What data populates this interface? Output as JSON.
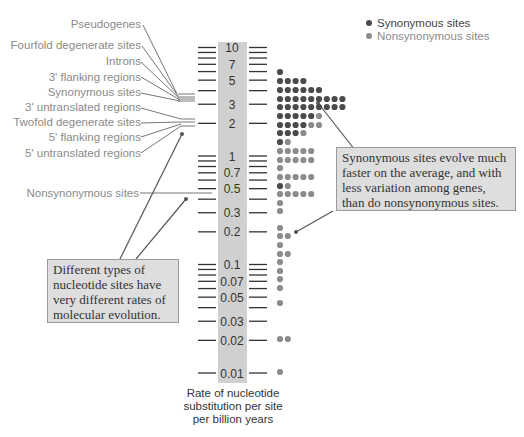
{
  "chart_data": {
    "type": "scatter",
    "title": "",
    "ylabel": "Rate of nucleotide substitution per site per billion years",
    "yscale": "log",
    "ylim": [
      0.01,
      10
    ],
    "tick_labels": [
      "10",
      "7",
      "5",
      "3",
      "2",
      "1",
      "0.7",
      "0.5",
      "0.3",
      "0.2",
      "0.1",
      "0.07",
      "0.05",
      "0.03",
      "0.02",
      "0.01"
    ],
    "tick_values": [
      10,
      7,
      5,
      3,
      2,
      1,
      0.7,
      0.5,
      0.3,
      0.2,
      0.1,
      0.07,
      0.05,
      0.03,
      0.02,
      0.01
    ],
    "legend": [
      {
        "name": "Synonymous sites",
        "color": "#4a4a4a"
      },
      {
        "name": "Nonsynonymous sites",
        "color": "#8c8c8c"
      }
    ],
    "dot_rows": [
      {
        "y": 72,
        "syn": 1,
        "nonsyn": 0
      },
      {
        "y": 81,
        "syn": 4,
        "nonsyn": 0
      },
      {
        "y": 90,
        "syn": 6,
        "nonsyn": 0
      },
      {
        "y": 99,
        "syn": 9,
        "nonsyn": 0
      },
      {
        "y": 107,
        "syn": 9,
        "nonsyn": 0
      },
      {
        "y": 116,
        "syn": 5,
        "nonsyn": 1
      },
      {
        "y": 125,
        "syn": 4,
        "nonsyn": 2
      },
      {
        "y": 133,
        "syn": 3,
        "nonsyn": 1
      },
      {
        "y": 142,
        "syn": 1,
        "nonsyn": 1
      },
      {
        "y": 151,
        "syn": 0,
        "nonsyn": 5
      },
      {
        "y": 160,
        "syn": 0,
        "nonsyn": 5
      },
      {
        "y": 168,
        "syn": 0,
        "nonsyn": 1
      },
      {
        "y": 177,
        "syn": 0,
        "nonsyn": 5
      },
      {
        "y": 186,
        "syn": 1,
        "nonsyn": 1
      },
      {
        "y": 194,
        "syn": 0,
        "nonsyn": 5
      },
      {
        "y": 203,
        "syn": 0,
        "nonsyn": 1
      },
      {
        "y": 211,
        "syn": 0,
        "nonsyn": 1
      },
      {
        "y": 228,
        "syn": 0,
        "nonsyn": 1
      },
      {
        "y": 236,
        "syn": 0,
        "nonsyn": 2
      },
      {
        "y": 245,
        "syn": 0,
        "nonsyn": 1
      },
      {
        "y": 254,
        "syn": 0,
        "nonsyn": 2
      },
      {
        "y": 262,
        "syn": 0,
        "nonsyn": 1
      },
      {
        "y": 271,
        "syn": 0,
        "nonsyn": 1
      },
      {
        "y": 279,
        "syn": 0,
        "nonsyn": 1
      },
      {
        "y": 288,
        "syn": 0,
        "nonsyn": 1
      },
      {
        "y": 303,
        "syn": 0,
        "nonsyn": 1
      },
      {
        "y": 339,
        "syn": 0,
        "nonsyn": 2
      },
      {
        "y": 372,
        "syn": 0,
        "nonsyn": 1
      }
    ],
    "site_labels": [
      "Pseudogenes",
      "Fourfold degenerate sites",
      "Introns",
      "3' flanking regions",
      "Synonymous sites",
      "3' untranslated regions",
      "Twofold degenerate sites",
      "5' flanking regions",
      "5' untranslated regions",
      "Nonsynonymous sites"
    ]
  },
  "axis": {
    "title_line1": "Rate of nucleotide",
    "title_line2": "substitution per site",
    "title_line3": "per billion years"
  },
  "legend": {
    "synonymous": "Synonymous sites",
    "nonsynonymous": "Nonsynonymous sites"
  },
  "labels": {
    "pseudogenes": "Pseudogenes",
    "fourfold": "Fourfold degenerate sites",
    "introns": "Introns",
    "flank3": "3' flanking regions",
    "synonymous": "Synonymous sites",
    "utr3": "3' untranslated regions",
    "twofold": "Twofold degenerate sites",
    "flank5": "5' flanking regions",
    "utr5": "5' untranslated regions",
    "nonsynonymous": "Nonsynonymous sites"
  },
  "callouts": {
    "right": "Synonymous sites evolve much faster on the average, and with less variation among genes, than do nonsynonymous sites.",
    "left": "Different types of nucleotide sites have very different rates of molecular evolution."
  },
  "colors": {
    "synonymous": "#4a4a4a",
    "nonsynonymous": "#8c8c8c",
    "scale_bar": "#d0d0d0",
    "callout_bg": "#dedede"
  }
}
